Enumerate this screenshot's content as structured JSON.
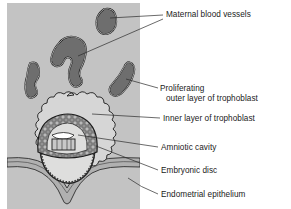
{
  "figure": {
    "background_color": "#ffffff",
    "tissue_panel_color": "#c3c3c3",
    "vessel_fill_color": "#6e6e6e",
    "vessel_outline_color": "#1a1a1a",
    "trophoblast_outer_color": "#d6d6d6",
    "trophoblast_inner_color": "#9a9a9a",
    "cavity_color": "#ffffff",
    "label_color": "#1a1a1a",
    "leader_color": "#2b2b2b"
  },
  "labels": [
    {
      "id": "maternal-blood-vessels",
      "lines": [
        "Maternal blood vessels"
      ],
      "x": 166,
      "y": 17
    },
    {
      "id": "proliferating-outer-trophoblast",
      "lines": [
        "Proliferating",
        "outer layer of trophoblast"
      ],
      "x": 160,
      "y": 91
    },
    {
      "id": "inner-layer-trophoblast",
      "lines": [
        "Inner layer of trophoblast"
      ],
      "x": 163,
      "y": 121
    },
    {
      "id": "amniotic-cavity",
      "lines": [
        "Amniotic cavity"
      ],
      "x": 161,
      "y": 150
    },
    {
      "id": "embryonic-disc",
      "lines": [
        "Embryonic disc"
      ],
      "x": 161,
      "y": 173
    },
    {
      "id": "endometrial-epithelium",
      "lines": [
        "Endometrial epithelium"
      ],
      "x": 161,
      "y": 197
    }
  ],
  "structures": [
    {
      "id": "maternal-vessel-1",
      "name": "maternal blood vessel (upper right, oval)"
    },
    {
      "id": "maternal-vessel-2",
      "name": "maternal blood vessel (centre, hook shaped)"
    },
    {
      "id": "maternal-vessel-3",
      "name": "maternal blood vessel (left, elongated)"
    },
    {
      "id": "maternal-vessel-4",
      "name": "maternal blood vessel (right, curved)"
    },
    {
      "id": "outer-trophoblast",
      "name": "proliferating outer layer of trophoblast"
    },
    {
      "id": "inner-trophoblast",
      "name": "inner layer of trophoblast"
    },
    {
      "id": "amniotic-cavity-shape",
      "name": "amniotic cavity"
    },
    {
      "id": "embryonic-disc-shape",
      "name": "embryonic disc"
    },
    {
      "id": "blastocyst-cavity",
      "name": "blastocyst cavity"
    },
    {
      "id": "endometrial-epithelium-band",
      "name": "endometrial epithelium"
    }
  ]
}
